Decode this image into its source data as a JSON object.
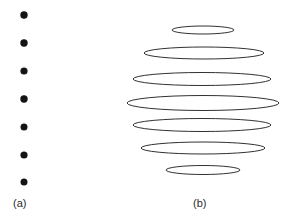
{
  "figure": {
    "background_color": "#ffffff",
    "width": 291,
    "height": 222,
    "stroke_color": "#1a1a1a",
    "dot_color": "#141414"
  },
  "panels": [
    {
      "id": "panel-a",
      "caption": "(a)",
      "caption_x": 13,
      "caption_y": 197,
      "type": "point-markers",
      "marker_shape": "filled-circle",
      "marker_count": 7,
      "marker_center_x": 24,
      "marker_radius": 3.6,
      "markers": [
        {
          "index": 1,
          "cx": 24,
          "cy": 15,
          "r": 3.7
        },
        {
          "index": 2,
          "cx": 24,
          "cy": 43,
          "r": 3.7
        },
        {
          "index": 3,
          "cx": 24,
          "cy": 71,
          "r": 3.6
        },
        {
          "index": 4,
          "cx": 24,
          "cy": 99,
          "r": 3.7
        },
        {
          "index": 5,
          "cx": 24,
          "cy": 127,
          "r": 3.5
        },
        {
          "index": 6,
          "cx": 24,
          "cy": 155,
          "r": 3.6
        },
        {
          "index": 7,
          "cx": 24,
          "cy": 182,
          "r": 3.5
        }
      ]
    },
    {
      "id": "panel-b",
      "caption": "(b)",
      "caption_x": 193,
      "caption_y": 197,
      "type": "ellipse-outlines",
      "ellipse_count": 7,
      "stroke_width": 0.9,
      "ellipses": [
        {
          "index": 1,
          "cx": 203,
          "cy": 30,
          "rx": 31,
          "ry": 4.0
        },
        {
          "index": 2,
          "cx": 204,
          "cy": 53,
          "rx": 60,
          "ry": 6.0
        },
        {
          "index": 3,
          "cx": 202,
          "cy": 79,
          "rx": 69,
          "ry": 6.5
        },
        {
          "index": 4,
          "cx": 203,
          "cy": 103,
          "rx": 76,
          "ry": 7.5
        },
        {
          "index": 5,
          "cx": 202,
          "cy": 125,
          "rx": 69,
          "ry": 6.5
        },
        {
          "index": 6,
          "cx": 203,
          "cy": 148,
          "rx": 62,
          "ry": 6.0
        },
        {
          "index": 7,
          "cx": 203,
          "cy": 170,
          "rx": 37,
          "ry": 4.5
        }
      ]
    }
  ],
  "chart_data": {
    "type": "scatter",
    "title": "",
    "xlabel": "",
    "ylabel": "",
    "grid": false,
    "legend": null,
    "annotations": [
      "(a)",
      "(b)"
    ],
    "series": [
      {
        "name": "(a) point sources",
        "marker": "filled-circle",
        "x": [
          24,
          24,
          24,
          24,
          24,
          24,
          24
        ],
        "y": [
          15,
          43,
          71,
          99,
          127,
          155,
          182
        ],
        "sizes": [
          7.4,
          7.4,
          7.2,
          7.4,
          7.0,
          7.2,
          7.0
        ]
      },
      {
        "name": "(b) ellipse outlines",
        "marker": "ellipse-outline",
        "x": [
          203,
          204,
          202,
          203,
          202,
          203,
          203
        ],
        "y": [
          30,
          53,
          79,
          103,
          125,
          148,
          170
        ],
        "widths": [
          62,
          120,
          138,
          152,
          138,
          124,
          74
        ],
        "heights": [
          8,
          12,
          13,
          15,
          13,
          12,
          9
        ]
      }
    ]
  }
}
